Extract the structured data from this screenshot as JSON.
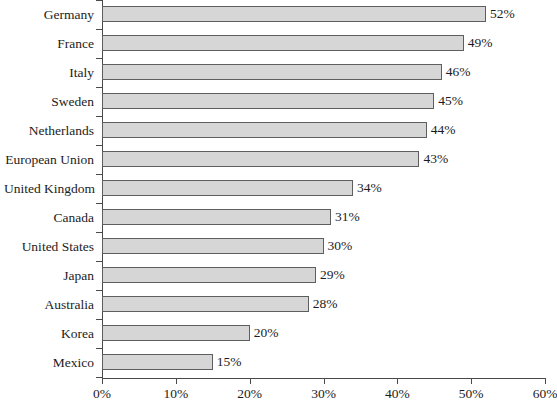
{
  "chart_data": {
    "type": "bar",
    "orientation": "horizontal",
    "title": "",
    "xlabel": "",
    "ylabel": "",
    "xlim": [
      0,
      60
    ],
    "xticks": [
      0,
      10,
      20,
      30,
      40,
      50,
      60
    ],
    "xtick_labels": [
      "0%",
      "10%",
      "20%",
      "30%",
      "40%",
      "50%",
      "60%"
    ],
    "grid": false,
    "legend": null,
    "value_suffix": "%",
    "categories": [
      "Germany",
      "France",
      "Italy",
      "Sweden",
      "Netherlands",
      "European Union",
      "United Kingdom",
      "Canada",
      "United States",
      "Japan",
      "Australia",
      "Korea",
      "Mexico"
    ],
    "values": [
      52,
      49,
      46,
      45,
      44,
      43,
      34,
      31,
      30,
      29,
      28,
      20,
      15
    ],
    "data_labels": [
      "52%",
      "49%",
      "46%",
      "45%",
      "44%",
      "43%",
      "34%",
      "31%",
      "30%",
      "29%",
      "28%",
      "20%",
      "15%"
    ]
  },
  "style": {
    "bar_fill": "#d6d6d6",
    "bar_border": "#5e5e5e",
    "axis_color": "#4a4a4a",
    "text_color": "#1c1c1c",
    "background": "#ffffff"
  }
}
